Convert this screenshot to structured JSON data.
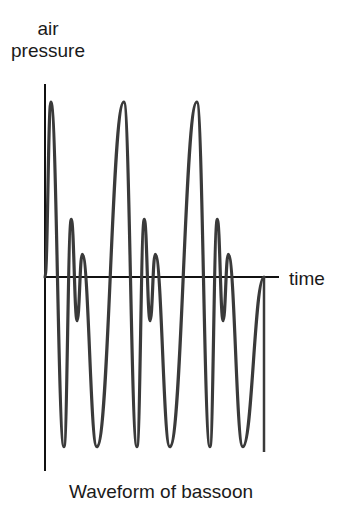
{
  "figure": {
    "ylabel_line1": "air",
    "ylabel_line2": "pressure",
    "xlabel": "time",
    "caption": "Waveform of bassoon"
  },
  "colors": {
    "axis": "#111111",
    "wave": "#3a3a3a",
    "background": "#ffffff"
  },
  "chart_data": {
    "type": "line",
    "title": "Waveform of bassoon",
    "xlabel": "time",
    "ylabel": "air pressure",
    "grid": false,
    "legend": "none",
    "period_px": 73,
    "cycles": 3,
    "relative_values_per_cycle": {
      "points": [
        "big_peak",
        "deep_trough",
        "medium_peak",
        "small_dip",
        "small_peak",
        "deep_trough"
      ],
      "values": [
        1.0,
        -0.97,
        0.33,
        -0.25,
        0.13,
        -0.97
      ]
    },
    "x": [
      0,
      0.08,
      0.26,
      0.36,
      0.44,
      0.51,
      0.71,
      1.08,
      1.26,
      1.36,
      1.44,
      1.51,
      1.71,
      2.08,
      2.26,
      2.36,
      2.44,
      2.51,
      2.71,
      3.0
    ],
    "y": [
      0,
      1.0,
      -0.97,
      0.33,
      -0.25,
      0.13,
      -0.97,
      1.0,
      -0.97,
      0.33,
      -0.25,
      0.13,
      -0.97,
      1.0,
      -0.97,
      0.33,
      -0.25,
      0.13,
      -0.97,
      0
    ]
  }
}
